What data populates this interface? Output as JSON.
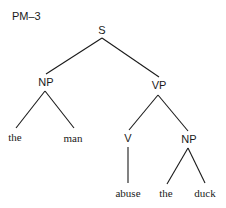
{
  "title": "PM–3",
  "tree": {
    "root": "S",
    "nodes": {
      "s": "S",
      "np_subject": "NP",
      "vp": "VP",
      "v": "V",
      "np_object": "NP"
    },
    "leaves": {
      "det_subject": "the",
      "noun_subject": "man",
      "verb": "abuse",
      "det_object": "the",
      "noun_object": "duck"
    },
    "structure": "[S [NP the man] [VP [V abuse] [NP the duck]]]"
  },
  "colors": {
    "ink": "#1a1a1a",
    "background": "#ffffff"
  }
}
